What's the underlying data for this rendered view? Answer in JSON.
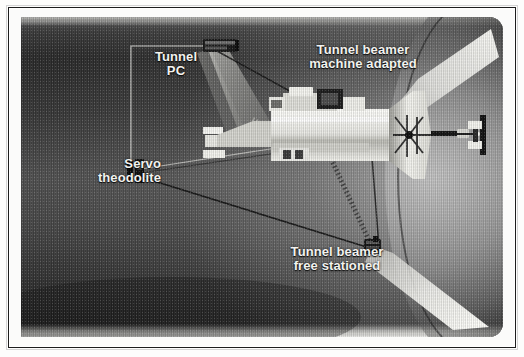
{
  "figure": {
    "kind": "tunnel-guidance-diagram",
    "caption_absent": true
  },
  "labels": {
    "tunnel_pc": "Tunnel\nPC",
    "servo_theodolite": "Servo\ntheodolite",
    "machine_adapted": "Tunnel beamer\nmachine adapted",
    "free_stationed": "Tunnel beamer\nfree stationed"
  },
  "elements": {
    "tunnel_pc_box": "tunnel-pc-unit",
    "servo_theodolite_instrument": "servo-theodolite-instrument",
    "tbm": "tunnel-boring-machine",
    "cutter_head": "cutter-head",
    "target_prism": "rear-target-prism",
    "free_station_beamer": "free-stationed-beamer",
    "sight_line_pc_to_machine": "sight-line",
    "sight_line_theodolite_to_machine": "sight-line",
    "sight_line_theodolite_to_beamer": "sight-line",
    "light_cone_upper": "light-cone",
    "light_cone_lower": "light-cone",
    "leader_bracket_pc": "leader-bracket"
  },
  "colors": {
    "label_text": "#f2f2ef",
    "tunnel_dark": "#2b2b2b",
    "tunnel_light": "#b9b9b6",
    "machine_body": "#f1f1ee",
    "beam_line": "#111111",
    "frame_rule": "#1d1d1d"
  }
}
